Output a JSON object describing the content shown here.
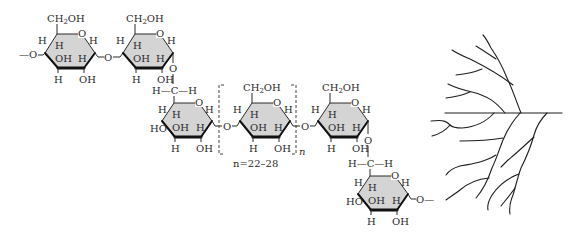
{
  "figure": {
    "repeat_label": "n=22–28",
    "repeat_subscript": "n",
    "colors": {
      "ring_fill": "#d4d4d4",
      "stroke": "#2a2a2a",
      "background": "#ffffff"
    }
  },
  "labels": {
    "ch2oh_main": "CH",
    "ch2oh_sub": "2",
    "ch2oh_tail": "OH",
    "H": "H",
    "OH": "OH",
    "HO": "HO",
    "O": "O",
    "chain_left": "—O",
    "chain_right": "O—",
    "hch": "H—C—H"
  },
  "rings": [
    {
      "id": "ring-1",
      "cx": 70,
      "cy": 50,
      "has_ch2oh": true,
      "c4_label": "H",
      "c3_label": "H"
    },
    {
      "id": "ring-2",
      "cx": 148,
      "cy": 50,
      "has_ch2oh": true,
      "c4_label": "H",
      "c3_label": "H"
    },
    {
      "id": "ring-3",
      "cx": 187,
      "cy": 119,
      "has_ch2oh": false,
      "c4_label": "HO",
      "c3_label": "H"
    },
    {
      "id": "ring-4",
      "cx": 265,
      "cy": 119,
      "has_ch2oh": true,
      "c4_label": "H",
      "c3_label": "H"
    },
    {
      "id": "ring-5",
      "cx": 343,
      "cy": 119,
      "has_ch2oh": true,
      "c4_label": "H",
      "c3_label": "H"
    },
    {
      "id": "ring-6",
      "cx": 383,
      "cy": 192,
      "has_ch2oh": false,
      "c4_label": "HO",
      "c3_label": "H"
    }
  ],
  "branch_diagram": {
    "description": "schematic branched tree representing glycogen/amylopectin branching",
    "trunk": {
      "x1": 445,
      "y1": 113,
      "x2": 562,
      "y2": 113
    }
  }
}
